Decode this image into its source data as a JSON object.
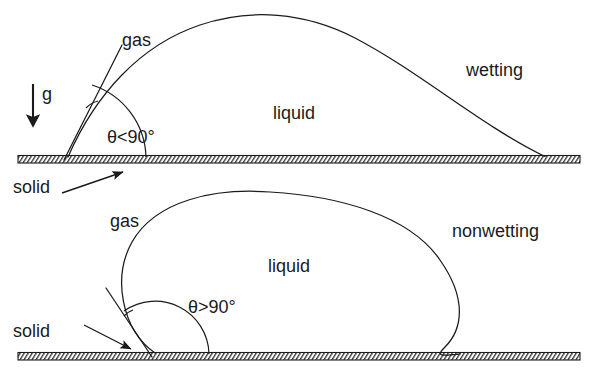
{
  "figure": {
    "title_visible": false,
    "background_color": "#ffffff",
    "stroke_color": "#1a1a1a",
    "width": 596,
    "height": 382
  },
  "panels": [
    {
      "id": "wetting",
      "name": "wetting-panel",
      "caption": "wetting",
      "angle_label": "θ<90°",
      "phase_labels": {
        "gas": "gas",
        "liquid": "liquid",
        "solid": "solid"
      },
      "gravity_label": "g",
      "substrate_y": 158,
      "contact_point_x": 68,
      "right_edge_x": 545,
      "apex_x": 290,
      "apex_y": 18,
      "contact_angle_deg": 55,
      "description": "low contact angle sessile drop spreading on solid substrate"
    },
    {
      "id": "nonwetting",
      "name": "nonwetting-panel",
      "caption": "nonwetting",
      "angle_label": "θ>90°",
      "phase_labels": {
        "gas": "gas",
        "liquid": "liquid",
        "solid": "solid"
      },
      "gravity_label": null,
      "substrate_y": 355,
      "contact_point_x": 155,
      "right_edge_x": 460,
      "apex_x": 300,
      "apex_y": 195,
      "contact_angle_deg": 125,
      "description": "high contact angle bulbous drop beading on solid substrate"
    }
  ],
  "labels": {
    "gas_top": "gas",
    "liquid_top": "liquid",
    "wetting": "wetting",
    "gravity": "g",
    "solid_top": "solid",
    "theta_top": "θ<90°",
    "gas_bottom": "gas",
    "liquid_bottom": "liquid",
    "nonwetting": "nonwetting",
    "solid_bottom": "solid",
    "theta_bottom": "θ>90°"
  },
  "colors": {
    "line": "#1a1a1a",
    "text": "#1a1a1a",
    "hatch": "#555555",
    "background": "#ffffff"
  }
}
